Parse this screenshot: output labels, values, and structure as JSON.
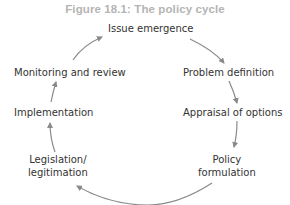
{
  "figure": {
    "title": "Figure 18.1: The policy cycle",
    "nodes": [
      {
        "id": "issue-emergence",
        "label": "Issue emergence"
      },
      {
        "id": "problem-definition",
        "label": "Problem definition"
      },
      {
        "id": "appraisal-of-options",
        "label": "Appraisal of options"
      },
      {
        "id": "policy-formulation",
        "label_line1": "Policy",
        "label_line2": "formulation"
      },
      {
        "id": "legislation-legitimation",
        "label_line1": "Legislation/",
        "label_line2": "legitimation"
      },
      {
        "id": "implementation",
        "label": "Implementation"
      },
      {
        "id": "monitoring-and-review",
        "label": "Monitoring and review"
      }
    ],
    "arrow_color": "#8a8a8a",
    "title_color": "#b4b4b4",
    "text_color": "#333333"
  }
}
